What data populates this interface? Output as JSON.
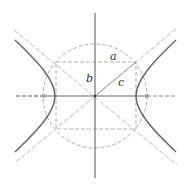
{
  "diagram": {
    "labels": {
      "a": "a",
      "b": "b",
      "c": "c"
    },
    "colors": {
      "axis": "#4a4a4a",
      "hyperbola": "#6e6e6e",
      "dashed": "#b5b5b5",
      "focus": "#9a9a9a"
    },
    "geometry": {
      "center": [
        95,
        96
      ],
      "a": 40,
      "b": 33,
      "c": 52
    }
  }
}
